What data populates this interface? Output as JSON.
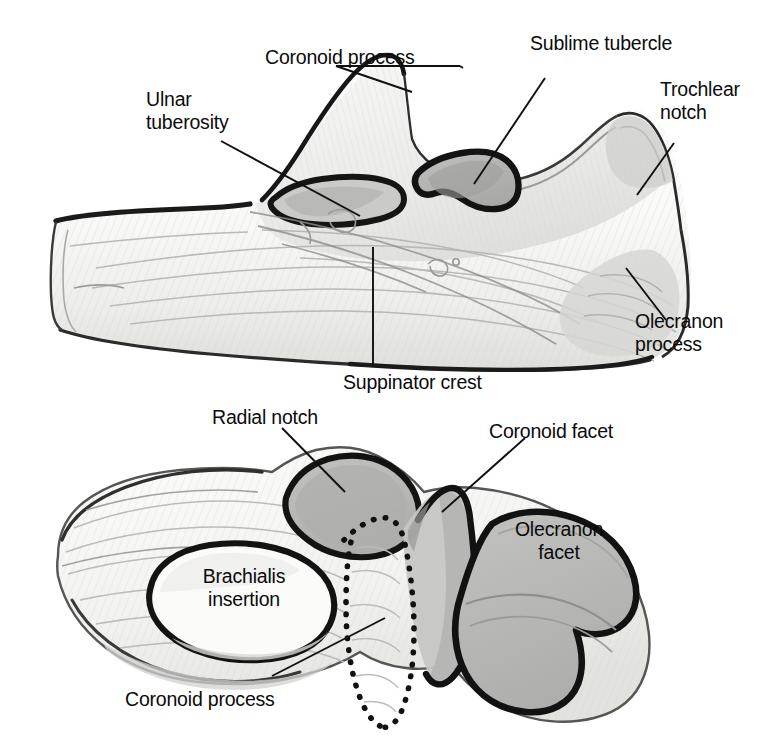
{
  "figure": {
    "panels": [
      {
        "id": "lateral-view",
        "name": "Proximal ulna, lateral view",
        "labels": [
          {
            "key": "coronoid_process",
            "text": "Coronoid process"
          },
          {
            "key": "sublime_tubercle",
            "text": "Sublime tubercle"
          },
          {
            "key": "trochlear_notch",
            "text": "Trochlear\nnotch"
          },
          {
            "key": "ulnar_tuberosity",
            "text": "Ulnar\ntuberosity"
          },
          {
            "key": "olecranon_process",
            "text": "Olecranon\nprocess"
          },
          {
            "key": "suppinator_crest",
            "text": "Suppinator crest"
          }
        ]
      },
      {
        "id": "articular-view",
        "name": "Proximal ulna, articular surface view",
        "labels": [
          {
            "key": "radial_notch",
            "text": "Radial notch"
          },
          {
            "key": "coronoid_facet",
            "text": "Coronoid facet"
          },
          {
            "key": "olecranon_facet",
            "text": "Olecranon\nfacet"
          },
          {
            "key": "brachialis_insertion",
            "text": "Brachialis\ninsertion"
          },
          {
            "key": "coronoid_process",
            "text": "Coronoid process"
          }
        ]
      }
    ]
  },
  "colors": {
    "background": "#ffffff",
    "ink": "#0b0b0b",
    "outline_dark": "#141414",
    "bone_light": "#fbfbfa",
    "bone_shade": "#e6e6e4",
    "bone_shade_mid": "#d2d2d0",
    "facet_gray": "#b9b9b8",
    "facet_gray_dark": "#a9a9a8",
    "hatch_gray": "#b0b0ae",
    "leader_line": "#101010"
  },
  "geometry": {
    "note": "Hand-drawn anatomical illustration rendered with SVG paths; coordinates in page pixels."
  }
}
